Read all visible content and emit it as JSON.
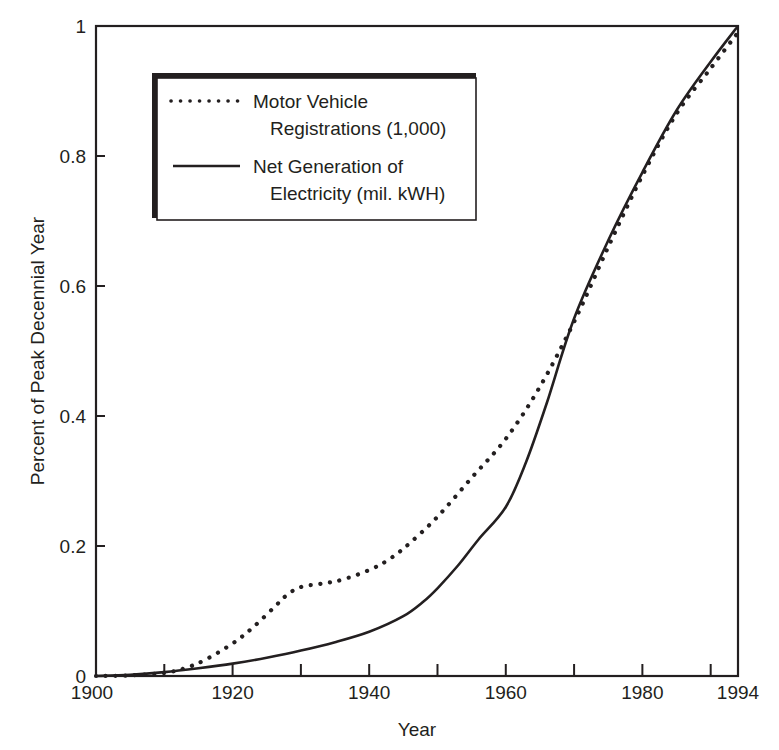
{
  "chart_data": {
    "type": "line",
    "title": "",
    "xlabel": "Year",
    "ylabel": "Percent of Peak Decennial Year",
    "xlim": [
      1900,
      1994
    ],
    "ylim": [
      0,
      1
    ],
    "grid": false,
    "legend_position": "upper-left",
    "x_ticks": [
      1900,
      1910,
      1920,
      1930,
      1940,
      1950,
      1960,
      1970,
      1980,
      1990,
      1994
    ],
    "x_tick_labels": [
      "1900",
      "1920",
      "1940",
      "1960",
      "1980",
      "1994"
    ],
    "x_tick_label_values": [
      1900,
      1920,
      1940,
      1960,
      1980,
      1994
    ],
    "y_ticks": [
      0,
      0.2,
      0.4,
      0.6,
      0.8,
      1
    ],
    "y_tick_labels": [
      "0",
      "0.2",
      "0.4",
      "0.6",
      "0.8",
      "1"
    ],
    "series": [
      {
        "name": "Motor Vehicle Registrations (1,000)",
        "legend_lines": [
          "Motor Vehicle",
          "Registrations (1,000)"
        ],
        "style": "dotted",
        "x": [
          1900,
          1905,
          1910,
          1913,
          1916,
          1920,
          1923,
          1926,
          1928,
          1930,
          1933,
          1936,
          1940,
          1943,
          1946,
          1950,
          1955,
          1960,
          1965,
          1970,
          1975,
          1980,
          1985,
          1990,
          1994
        ],
        "values": [
          0,
          0.001,
          0.005,
          0.012,
          0.025,
          0.05,
          0.075,
          0.105,
          0.125,
          0.137,
          0.142,
          0.148,
          0.163,
          0.18,
          0.205,
          0.245,
          0.305,
          0.365,
          0.445,
          0.545,
          0.66,
          0.77,
          0.865,
          0.935,
          0.99
        ]
      },
      {
        "name": "Net Generation of Electricity (mil. kWH)",
        "legend_lines": [
          "Net Generation of",
          "Electricity (mil. kWH)"
        ],
        "style": "solid",
        "x": [
          1900,
          1905,
          1910,
          1915,
          1920,
          1925,
          1930,
          1935,
          1940,
          1945,
          1948,
          1950,
          1953,
          1956,
          1960,
          1963,
          1966,
          1970,
          1975,
          1980,
          1985,
          1990,
          1994
        ],
        "values": [
          0,
          0.002,
          0.006,
          0.012,
          0.019,
          0.028,
          0.039,
          0.052,
          0.068,
          0.092,
          0.115,
          0.135,
          0.17,
          0.21,
          0.26,
          0.33,
          0.42,
          0.55,
          0.67,
          0.775,
          0.87,
          0.945,
          1.0
        ]
      }
    ]
  },
  "colors": {
    "ink": "#231f20",
    "background": "#ffffff"
  }
}
